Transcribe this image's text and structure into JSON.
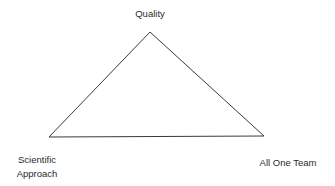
{
  "diagram": {
    "type": "triangle",
    "line_color": "#3a3a3a",
    "background": "#ffffff",
    "vertices": {
      "top": {
        "label": "Quality"
      },
      "bottom_left": {
        "label_line1": "Scientific",
        "label_line2": "Approach"
      },
      "bottom_right": {
        "label": "All One Team"
      }
    }
  }
}
